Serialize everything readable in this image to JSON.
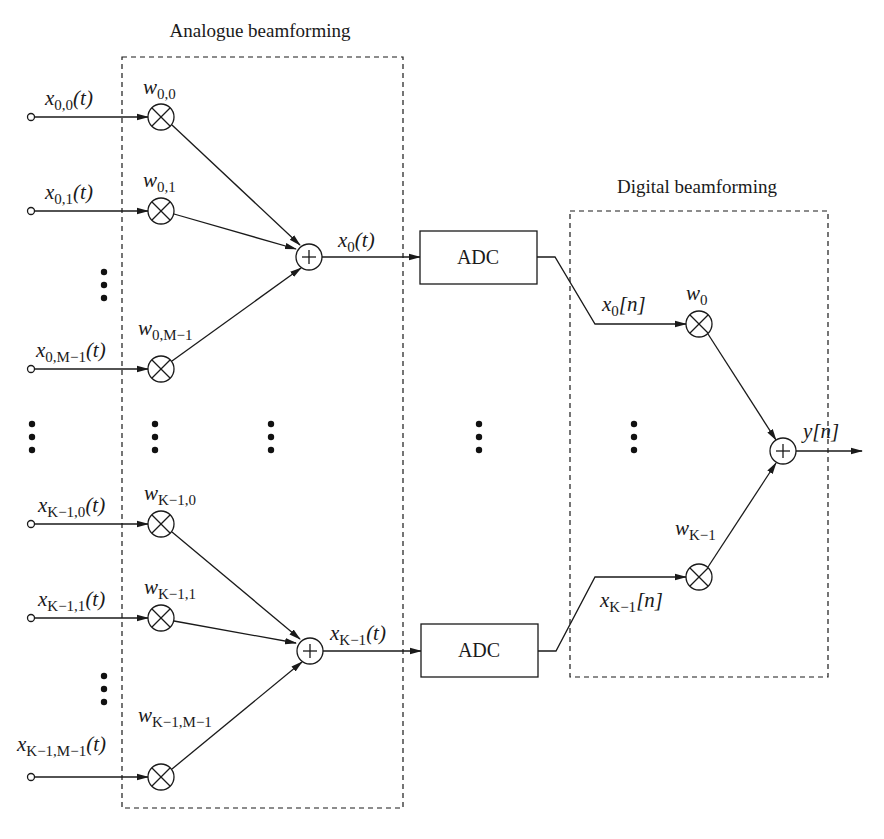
{
  "diagram": {
    "analogue": {
      "title": "Analogue beamforming",
      "inputs": [
        {
          "base": "x",
          "sub": "0,0",
          "suffix": "(t)"
        },
        {
          "base": "x",
          "sub": "0,1",
          "suffix": "(t)"
        },
        {
          "base": "x",
          "sub": "0,M−1",
          "suffix": "(t)"
        },
        {
          "base": "x",
          "sub": "K−1,0",
          "suffix": "(t)"
        },
        {
          "base": "x",
          "sub": "K−1,1",
          "suffix": "(t)"
        },
        {
          "base": "x",
          "sub": "K−1,M−1",
          "suffix": "(t)"
        }
      ],
      "weights": [
        {
          "base": "w",
          "sub": "0,0"
        },
        {
          "base": "w",
          "sub": "0,1"
        },
        {
          "base": "w",
          "sub": "0,M−1"
        },
        {
          "base": "w",
          "sub": "K−1,0"
        },
        {
          "base": "w",
          "sub": "K−1,1"
        },
        {
          "base": "w",
          "sub": "K−1,M−1"
        }
      ],
      "outputs": [
        {
          "base": "x",
          "sub": "0",
          "suffix": "(t)"
        },
        {
          "base": "x",
          "sub": "K−1",
          "suffix": "(t)"
        }
      ]
    },
    "adc": {
      "labels": [
        "ADC",
        "ADC"
      ]
    },
    "digital": {
      "title": "Digital beamforming",
      "inputs": [
        {
          "base": "x",
          "sub": "0",
          "suffix": "[n]"
        },
        {
          "base": "x",
          "sub": "K−1",
          "suffix": "[n]"
        }
      ],
      "weights": [
        {
          "base": "w",
          "sub": "0"
        },
        {
          "base": "w",
          "sub": "K−1"
        }
      ],
      "output": {
        "base": "y",
        "suffix": "[n]"
      }
    },
    "symbols": {
      "multiply": "×",
      "add": "+"
    }
  }
}
